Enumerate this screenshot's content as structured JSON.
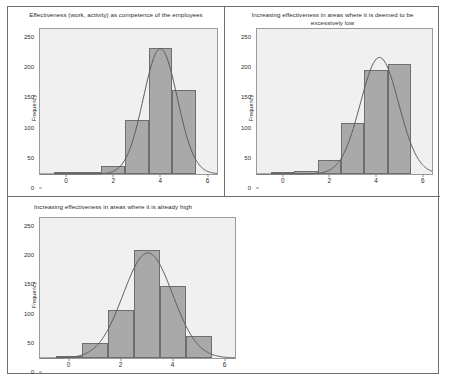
{
  "figure": {
    "panel_count": 3,
    "bar_color": "#a9a9a9",
    "bar_edge_color": "#6e6e6e",
    "plot_bg_color": "#f0f0f0",
    "curve_color": "#5d5d5d",
    "frame_color": "#6f6f6f"
  },
  "chart_data": [
    {
      "type": "bar",
      "title": "Effectiveness (work, activity) as competence of the employees",
      "xlabel": "",
      "ylabel": "Frequency",
      "categories": [
        "0",
        "1",
        "2",
        "3",
        "4",
        "5"
      ],
      "bin_edges": [
        -0.5,
        0.5,
        1.5,
        2.5,
        3.5,
        4.5,
        5.5
      ],
      "values": [
        1,
        4,
        15,
        99,
        230,
        153
      ],
      "ylim": [
        0,
        265
      ],
      "xlim": [
        -1.1,
        6.4
      ],
      "yticks": [
        0,
        50,
        100,
        150,
        200,
        250
      ],
      "xticks": [
        0,
        2,
        4,
        6
      ],
      "grid": false,
      "legend": "none",
      "normal_curve": {
        "mean": 4.0,
        "sd": 0.72,
        "peak": 229
      }
    },
    {
      "type": "bar",
      "title": "Increasing effectiveness in areas where it is deemed to be excessively low",
      "xlabel": "",
      "ylabel": "Frequency",
      "categories": [
        "0",
        "1",
        "2",
        "3",
        "4",
        "5"
      ],
      "bin_edges": [
        -0.5,
        0.5,
        1.5,
        2.5,
        3.5,
        4.5,
        5.5
      ],
      "values": [
        1,
        6,
        26,
        94,
        190,
        201
      ],
      "ylim": [
        0,
        265
      ],
      "xlim": [
        -1.1,
        6.4
      ],
      "yticks": [
        0,
        50,
        100,
        150,
        200,
        250
      ],
      "xticks": [
        0,
        2,
        4,
        6
      ],
      "grid": false,
      "legend": "none",
      "normal_curve": {
        "mean": 4.15,
        "sd": 0.82,
        "peak": 213
      }
    },
    {
      "type": "bar",
      "title": "Increasing effectiveness in areas where it is already high",
      "xlabel": "",
      "ylabel": "Frequency",
      "categories": [
        "0",
        "1",
        "2",
        "3",
        "4",
        "5"
      ],
      "bin_edges": [
        -0.5,
        0.5,
        1.5,
        2.5,
        3.5,
        4.5,
        5.5
      ],
      "values": [
        2,
        28,
        90,
        204,
        137,
        42
      ],
      "ylim": [
        0,
        265
      ],
      "xlim": [
        -1.1,
        6.4
      ],
      "yticks": [
        0,
        50,
        100,
        150,
        200,
        250
      ],
      "xticks": [
        0,
        2,
        4,
        6
      ],
      "grid": false,
      "legend": "none",
      "normal_curve": {
        "mean": 3.05,
        "sd": 0.95,
        "peak": 199
      }
    }
  ]
}
